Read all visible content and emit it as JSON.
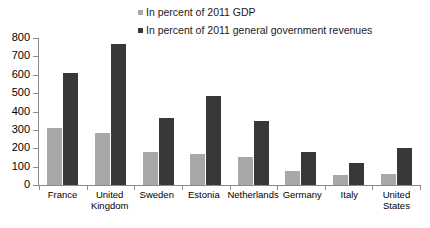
{
  "chart_data": {
    "type": "bar",
    "title": "",
    "xlabel": "",
    "ylabel": "",
    "ylim": [
      0,
      800
    ],
    "ytick_step": 100,
    "yticks": [
      800,
      700,
      600,
      500,
      400,
      300,
      200,
      100,
      0
    ],
    "grid": false,
    "legend_position": "top-center",
    "categories": [
      "France",
      "United Kingdom",
      "Sweden",
      "Estonia",
      "Netherlands",
      "Germany",
      "Italy",
      "United States"
    ],
    "category_lines": [
      [
        "France"
      ],
      [
        "United",
        "Kingdom"
      ],
      [
        "Sweden"
      ],
      [
        "Estonia"
      ],
      [
        "Netherlands"
      ],
      [
        "Germany"
      ],
      [
        "Italy"
      ],
      [
        "United",
        "States"
      ]
    ],
    "series": [
      {
        "name": "In percent of 2011 GDP",
        "color": "#a8a8a8",
        "values": [
          310,
          282,
          178,
          170,
          155,
          78,
          52,
          58
        ]
      },
      {
        "name": "In percent of 2011 general government revenues",
        "color": "#383838",
        "values": [
          607,
          770,
          367,
          487,
          348,
          182,
          120,
          203
        ]
      }
    ]
  },
  "legend": {
    "entries": [
      {
        "label": "In percent of 2011 GDP",
        "color": "#a8a8a8"
      },
      {
        "label": "In percent of 2011 general government revenues",
        "color": "#383838"
      }
    ]
  },
  "footnote": {
    "text": ""
  }
}
